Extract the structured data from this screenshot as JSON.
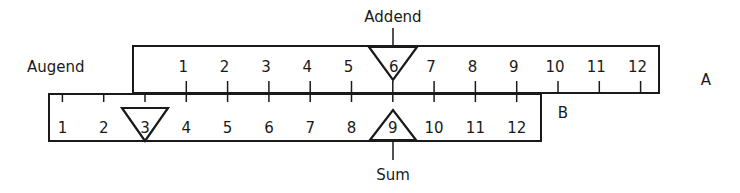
{
  "figure": {
    "labels": {
      "augend": "Augend",
      "addend": "Addend",
      "sum": "Sum",
      "ruler_a": "A",
      "ruler_b": "B"
    },
    "ruler_a": {
      "name": "A",
      "scale": [
        "1",
        "2",
        "3",
        "4",
        "5",
        "6",
        "7",
        "8",
        "9",
        "10",
        "11",
        "12"
      ],
      "highlighted_value": "6",
      "highlight_role": "Addend"
    },
    "ruler_b": {
      "name": "B",
      "scale": [
        "1",
        "2",
        "3",
        "4",
        "5",
        "6",
        "7",
        "8",
        "9",
        "10",
        "11",
        "12"
      ],
      "highlighted_values": [
        "3",
        "9"
      ],
      "highlight_roles": [
        "Augend",
        "Sum"
      ]
    },
    "example": {
      "augend": 3,
      "addend": 6,
      "sum": 9
    }
  }
}
